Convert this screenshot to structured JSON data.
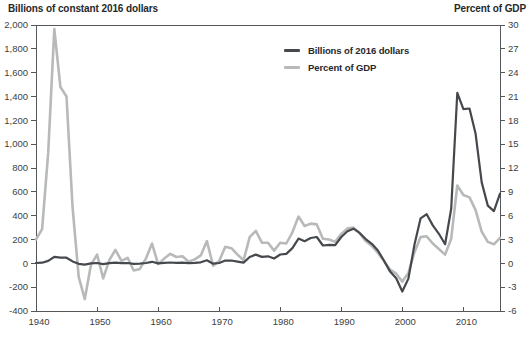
{
  "figure": {
    "left_axis_title": "Billions of constant 2016 dollars",
    "right_axis_title": "Percent of GDP"
  },
  "legend": {
    "position": "inside-top-center",
    "items": [
      {
        "label": "Billions of 2016 dollars",
        "color": "#45484d"
      },
      {
        "label": "Percent of GDP",
        "color": "#b8bab9"
      }
    ]
  },
  "colors": {
    "billions_line": "#45484d",
    "percent_line": "#b8bab9",
    "axis_line": "#55585a",
    "tick_label": "#3c3e41",
    "background": "#ffffff"
  },
  "chart_data": {
    "type": "line",
    "title": "",
    "grid": "off",
    "legend_position": "inside-top-center",
    "x_axis": {
      "range": [
        1940,
        2016
      ],
      "tick_years": [
        1940,
        1950,
        1960,
        1970,
        1980,
        1990,
        2000,
        2010
      ],
      "tick_labels": [
        "1940",
        "1950",
        "1960",
        "1970",
        "1980",
        "1990",
        "2000",
        "2010"
      ]
    },
    "left_axis": {
      "title": "Billions of constant 2016 dollars",
      "min": -400,
      "max": 2000,
      "tick_step": 200,
      "tick_labels_top_to_bottom": [
        "2,000",
        "1,800",
        "1,600",
        "1,400",
        "1,200",
        "1,000",
        "800",
        "600",
        "400",
        "200",
        "0",
        "-200",
        "-400"
      ]
    },
    "right_axis": {
      "title": "Percent of GDP",
      "min": -6,
      "max": 30,
      "tick_step": 3,
      "tick_labels_top_to_bottom": [
        "30",
        "27",
        "24",
        "21",
        "18",
        "15",
        "12",
        "9",
        "6",
        "3",
        "0",
        "-3",
        "-6"
      ]
    },
    "x": [
      1940,
      1941,
      1942,
      1943,
      1944,
      1945,
      1946,
      1947,
      1948,
      1949,
      1950,
      1951,
      1952,
      1953,
      1954,
      1955,
      1956,
      1957,
      1958,
      1959,
      1960,
      1961,
      1962,
      1963,
      1964,
      1965,
      1966,
      1967,
      1968,
      1969,
      1970,
      1971,
      1972,
      1973,
      1974,
      1975,
      1976,
      1977,
      1978,
      1979,
      1980,
      1981,
      1982,
      1983,
      1984,
      1985,
      1986,
      1987,
      1988,
      1989,
      1990,
      1991,
      1992,
      1993,
      1994,
      1995,
      1996,
      1997,
      1998,
      1999,
      2000,
      2001,
      2002,
      2003,
      2004,
      2005,
      2006,
      2007,
      2008,
      2009,
      2010,
      2011,
      2012,
      2013,
      2014,
      2015,
      2016
    ],
    "series": [
      {
        "name": "Billions of 2016 dollars",
        "axis": "left",
        "color": "#45484d",
        "stroke_width": 2.2,
        "values": [
          2.9,
          4.9,
          20.5,
          54.6,
          47.6,
          47.6,
          15.9,
          -4.0,
          -11.8,
          -0.6,
          3.1,
          -6.1,
          1.5,
          6.5,
          1.2,
          3.0,
          -3.9,
          -3.4,
          2.8,
          12.8,
          -0.3,
          3.3,
          7.1,
          4.8,
          5.9,
          1.4,
          3.7,
          8.6,
          25.2,
          -3.2,
          2.8,
          23.0,
          23.4,
          14.9,
          6.1,
          53.2,
          73.7,
          53.7,
          59.2,
          40.7,
          73.8,
          79.0,
          128.0,
          207.8,
          185.4,
          212.3,
          221.2,
          149.7,
          155.2,
          152.6,
          221.0,
          269.2,
          290.3,
          255.1,
          203.2,
          164.0,
          107.4,
          21.9,
          -69.3,
          -125.6,
          -236.2,
          -128.2,
          157.8,
          377.6,
          412.7,
          318.3,
          248.2,
          160.7,
          458.6,
          1430.0,
          1294.4,
          1299.6,
          1087.0,
          679.5,
          484.6,
          438.5,
          584.7
        ]
      },
      {
        "name": "Percent of GDP",
        "axis": "right",
        "color": "#b8bab9",
        "stroke_width": 2.6,
        "values": [
          3.0,
          4.3,
          13.9,
          29.5,
          22.2,
          21.0,
          7.0,
          -1.7,
          -4.5,
          -0.2,
          1.1,
          -1.9,
          0.4,
          1.7,
          0.3,
          0.7,
          -0.9,
          -0.7,
          0.6,
          2.5,
          -0.1,
          0.6,
          1.2,
          0.8,
          0.9,
          0.2,
          0.5,
          1.0,
          2.8,
          -0.3,
          0.3,
          2.1,
          1.9,
          1.1,
          0.4,
          3.3,
          4.1,
          2.6,
          2.6,
          1.6,
          2.6,
          2.5,
          3.9,
          5.9,
          4.7,
          5.0,
          4.9,
          3.1,
          3.0,
          2.7,
          3.7,
          4.4,
          4.5,
          3.8,
          2.8,
          2.2,
          1.3,
          0.3,
          -0.8,
          -1.3,
          -2.3,
          -1.2,
          1.4,
          3.3,
          3.4,
          2.5,
          1.8,
          1.1,
          3.1,
          9.8,
          8.6,
          8.3,
          6.7,
          4.0,
          2.7,
          2.4,
          3.2
        ]
      }
    ]
  }
}
